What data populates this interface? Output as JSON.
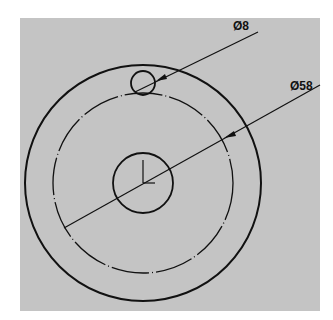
{
  "drawing": {
    "type": "technical-drawing",
    "background_color": "#c4c4c4",
    "line_color": "#111111",
    "dimensions": [
      {
        "id": "hole-diameter",
        "label": "Ø8",
        "value": 8,
        "target": "small-hole"
      },
      {
        "id": "pitch-diameter",
        "label": "Ø58",
        "value": 58,
        "target": "pitch-circle"
      }
    ],
    "features": {
      "outer_circle": "solid",
      "pitch_circle": "dash-dot",
      "center_bore": "solid",
      "small_hole": "solid",
      "origin_marker": "axis-triad"
    }
  }
}
